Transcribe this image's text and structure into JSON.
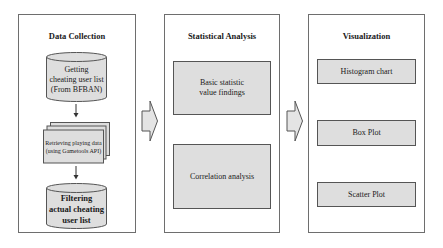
{
  "diagram": {
    "panels": [
      {
        "title": "Data Collection",
        "steps": [
          {
            "shape": "cylinder",
            "lines": [
              "Getting",
              "cheating user list",
              "(From BFBAN)"
            ]
          },
          {
            "shape": "multi-document",
            "lines": [
              "Retrieving playing data",
              "(using Gametools API)"
            ]
          },
          {
            "shape": "cylinder",
            "lines": [
              "Filtering",
              "actual cheating",
              "user list"
            ]
          }
        ]
      },
      {
        "title": "Statistical Analysis",
        "steps": [
          {
            "shape": "rect",
            "lines": [
              "Basic statistic",
              "value findings"
            ]
          },
          {
            "shape": "rect",
            "lines": [
              "Correlation analysis"
            ]
          }
        ]
      },
      {
        "title": "Visualization",
        "steps": [
          {
            "shape": "rect",
            "lines": [
              "Histogram chart"
            ]
          },
          {
            "shape": "rect",
            "lines": [
              "Box Plot"
            ]
          },
          {
            "shape": "rect",
            "lines": [
              "Scatter Plot"
            ]
          }
        ]
      }
    ],
    "connectors": [
      {
        "from": "Data Collection",
        "to": "Statistical Analysis",
        "style": "block-arrow"
      },
      {
        "from": "Statistical Analysis",
        "to": "Visualization",
        "style": "block-arrow"
      }
    ],
    "colors": {
      "box_fill": "#dedede",
      "border": "#555555",
      "panel_border": "#6e6e6e",
      "arrow_fill": "#e4e4e4"
    }
  }
}
